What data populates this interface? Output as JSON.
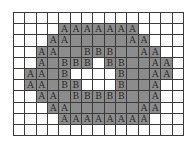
{
  "diagram": {
    "title": "",
    "rows": 11,
    "cols": 15,
    "colors": {
      "filled": "#8c8c8c",
      "empty": "#ffffff",
      "grid_line": "#3a3a3a",
      "text": "#2a2a2a"
    },
    "legend_note": "'A' = outer boundary cells, 'B' = inner boundary cells, gray = region, '.' filled without label, '_' empty",
    "grid": [
      "_______________",
      "____AAAAAAA____",
      "___AA.....AA___",
      "__AA..BBB..AA__",
      "__A.BBB_BB..AA_",
      "_AA.B____B..AA_",
      "_AA.BB___B..A__",
      "__AA.BBBBB..A__",
      "___AA......AA__",
      "____AAAAAAAA___",
      "_______________"
    ]
  }
}
